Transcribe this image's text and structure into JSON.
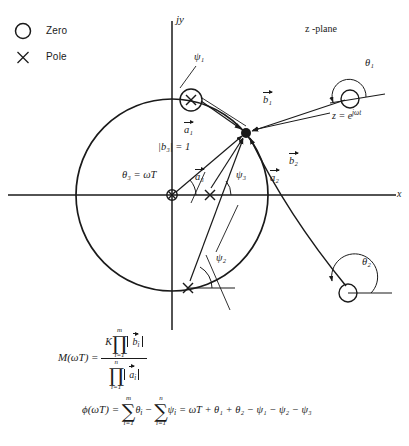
{
  "figure": {
    "kind": "z-plane pole-zero diagram with vector construction",
    "plane_label": "z -plane",
    "axis_imag_label": "jy",
    "axis_real_label": "x"
  },
  "legend": {
    "items": [
      {
        "symbol": "circle-icon",
        "label": "Zero"
      },
      {
        "symbol": "cross-icon",
        "label": "Pole"
      }
    ]
  },
  "annotations": {
    "unit_point_label": "z = e",
    "unit_point_exponent": "jωt",
    "b3_magnitude": "|b₃|  = 1",
    "theta3": "θ₃  =  ωT",
    "angles": [
      "ψ₁",
      "ψ₂",
      "ψ₃",
      "θ₁",
      "θ₂"
    ],
    "vectors": [
      "a₁",
      "a₂",
      "a₃",
      "b₁",
      "b₂"
    ]
  },
  "equations": {
    "magnitude": {
      "lhs": "M(ωT)  =",
      "gain": "K",
      "prod_glyph": "∏",
      "num_top": "m",
      "num_bottom": "i=1",
      "num_term": "b",
      "num_term_sub": "i",
      "den_top": "n",
      "den_bottom": "i=1",
      "den_term": "a",
      "den_term_sub": "i"
    },
    "phase": {
      "lhs": "ϕ(ωT)  =",
      "sum_glyph": "∑",
      "sum1_top": "m",
      "sum1_bottom": "i=1",
      "sum1_term": "θ",
      "sum1_sub": "i",
      "minus": "−",
      "sum2_top": "n",
      "sum2_bottom": "i=1",
      "sum2_term": "ψ",
      "sum2_sub": "i",
      "rhs": "=  ωT + θ₁ + θ₂ − ψ₁ − ψ₂ − ψ₃"
    }
  }
}
